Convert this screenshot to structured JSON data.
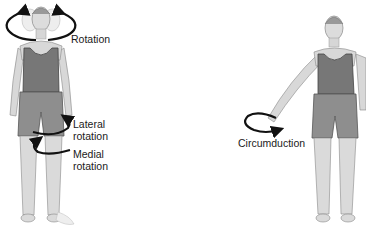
{
  "figure": {
    "left_figure": {
      "labels": {
        "rotation": "Rotation",
        "lateral_line1": "Lateral",
        "lateral_line2": "rotation",
        "medial_line1": "Medial",
        "medial_line2": "rotation"
      }
    },
    "right_figure": {
      "labels": {
        "circumduction": "Circumduction"
      }
    },
    "colors": {
      "skin": "#d9d9d9",
      "skin_outline": "#8a8a8a",
      "tank_top": "#7a7a7a",
      "shorts": "#8e8e8e",
      "arrow": "#111111",
      "background": "#ffffff"
    }
  }
}
